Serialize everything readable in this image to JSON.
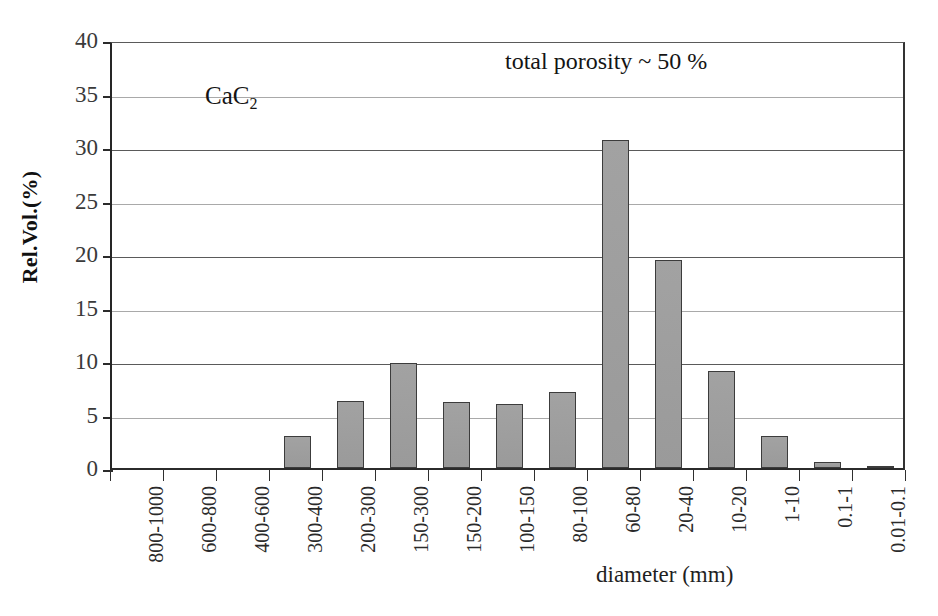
{
  "chart_data": {
    "type": "bar",
    "title": "",
    "xlabel": "diameter (mm)",
    "ylabel": "Rel.Vol.(%)",
    "ylim": [
      0,
      40
    ],
    "yticks": [
      0,
      5,
      10,
      15,
      20,
      25,
      30,
      35,
      40
    ],
    "grid": true,
    "legend_position": "none",
    "bar_fill_color": "#9c9c9c",
    "bar_edge_color": "#3c3c3c",
    "categories": [
      "800-1000",
      "600-800",
      "400-600",
      "300-400",
      "200-300",
      "150-300",
      "150-200",
      "100-150",
      "80-100",
      "60-80",
      "20-40",
      "10-20",
      "1-10",
      "0.1-1",
      "0.01-0.1"
    ],
    "values": [
      0,
      0,
      0,
      3.0,
      6.3,
      9.8,
      6.2,
      6.0,
      7.1,
      30.7,
      19.4,
      9.1,
      3.0,
      0.6,
      0.2
    ],
    "annotations": [
      {
        "name": "total-porosity",
        "text": "total porosity ~ 50 %"
      },
      {
        "name": "sample-label",
        "text": "CaC2",
        "text_main": "CaC",
        "text_sub": "2"
      }
    ]
  },
  "axes": {
    "y_tick_labels": [
      "0",
      "5",
      "10",
      "15",
      "20",
      "25",
      "30",
      "35",
      "40"
    ],
    "y_title": "Rel.Vol.(%)",
    "x_title": "diameter (mm)"
  }
}
